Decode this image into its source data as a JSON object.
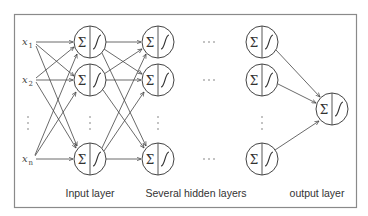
{
  "diagram": {
    "colors": {
      "stroke": "#444444",
      "frame": "#8a8a8a",
      "text": "#333333",
      "background": "#ffffff"
    },
    "inputs": [
      {
        "label": "x",
        "subscript": "1"
      },
      {
        "label": "x",
        "subscript": "2"
      },
      {
        "label": "x",
        "subscript": "n"
      }
    ],
    "node_symbols": {
      "sum": "Σ",
      "activation": "sigmoid"
    },
    "layer_labels": {
      "input": "Input layer",
      "hidden": "Several hidden layers",
      "output": "output layer"
    },
    "ellipsis_horizontal": "···",
    "ellipsis_vertical": "⋮"
  }
}
